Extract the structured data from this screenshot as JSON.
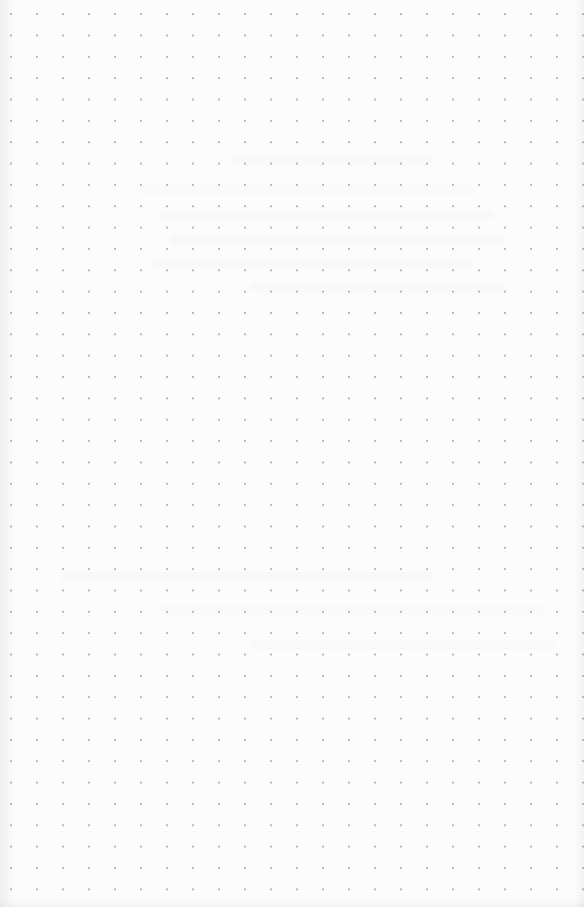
{
  "page": {
    "type": "dot-grid paper",
    "background_color": "#fcfcfc",
    "dot_color": "#b9b9b9",
    "dot_spacing_x": 26,
    "dot_spacing_y": 21.35,
    "columns": 22,
    "rows": 42,
    "visible_text": ""
  }
}
